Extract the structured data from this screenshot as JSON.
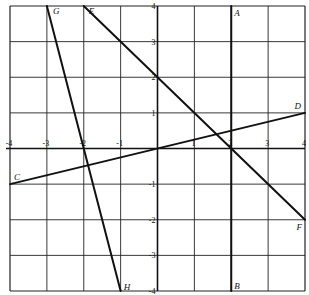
{
  "chart_data": {
    "type": "line",
    "title": "",
    "xlabel": "",
    "ylabel": "",
    "xlim": [
      -4,
      4
    ],
    "ylim": [
      -4,
      4
    ],
    "grid": true,
    "x_ticks": [
      -4,
      -3,
      -2,
      -1,
      1,
      2,
      3,
      4
    ],
    "y_ticks": [
      4,
      3,
      2,
      1,
      -1,
      -2,
      -3,
      -4
    ],
    "series": [
      {
        "name": "AB",
        "start_label": "A",
        "end_label": "B",
        "points": [
          [
            2,
            4
          ],
          [
            2,
            -4
          ]
        ]
      },
      {
        "name": "CD",
        "start_label": "C",
        "end_label": "D",
        "points": [
          [
            -4,
            -1
          ],
          [
            4,
            1
          ]
        ]
      },
      {
        "name": "EF",
        "start_label": "E",
        "end_label": "F",
        "points": [
          [
            -2,
            4
          ],
          [
            4,
            -2
          ]
        ]
      },
      {
        "name": "GH",
        "start_label": "G",
        "end_label": "H",
        "points": [
          [
            -3,
            4
          ],
          [
            -1,
            -4
          ]
        ]
      }
    ],
    "legend": null
  },
  "colors": {
    "ink": "#111111",
    "grid": "#222222",
    "background": "#ffffff"
  }
}
